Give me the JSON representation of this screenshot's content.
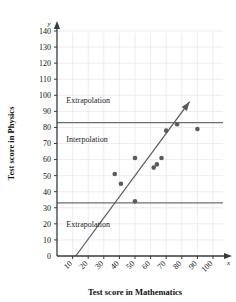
{
  "chart_data": {
    "type": "scatter",
    "title": "",
    "xlabel": "Test score in Mathematics",
    "ylabel": "Test score in Physics",
    "x_axis_symbol": "x",
    "y_axis_symbol": "y",
    "xlim": [
      0,
      100
    ],
    "ylim": [
      0,
      140
    ],
    "xticks": [
      0,
      10,
      20,
      30,
      40,
      50,
      60,
      70,
      80,
      90,
      100
    ],
    "yticks": [
      0,
      10,
      20,
      30,
      40,
      50,
      60,
      70,
      80,
      90,
      100,
      110,
      120,
      130,
      140
    ],
    "xtick_labels": [
      "0",
      "10",
      "20",
      "30",
      "40",
      "50",
      "60",
      "70",
      "80",
      "90",
      "100"
    ],
    "ytick_labels": [
      "0",
      "10",
      "20",
      "30",
      "40",
      "50",
      "60",
      "70",
      "80",
      "90",
      "100",
      "110",
      "120",
      "130",
      "140"
    ],
    "grid": true,
    "legend": "none",
    "point_color": "#5a5a5a",
    "line_color": "#5a5a5a",
    "boundary_color": "#6e6e6e",
    "grid_color": "#e4e4ec",
    "axis_color": "#3a3a3a",
    "points": [
      {
        "x": 37,
        "y": 51
      },
      {
        "x": 41,
        "y": 45
      },
      {
        "x": 50,
        "y": 61
      },
      {
        "x": 50,
        "y": 34
      },
      {
        "x": 62,
        "y": 55
      },
      {
        "x": 64,
        "y": 57
      },
      {
        "x": 67,
        "y": 61
      },
      {
        "x": 70,
        "y": 78
      },
      {
        "x": 77,
        "y": 82
      },
      {
        "x": 90,
        "y": 79
      }
    ],
    "trend_line": {
      "x1": 12,
      "y1": 0,
      "x2": 85,
      "y2": 96,
      "arrow": true
    },
    "boundaries": [
      {
        "value": 83,
        "label": "upper-interpolation-boundary"
      },
      {
        "value": 33,
        "label": "lower-interpolation-boundary"
      }
    ],
    "annotations": [
      {
        "text": "Extrapolation",
        "x": 6,
        "y": 97,
        "name": "upper-extrapolation-label"
      },
      {
        "text": "Interpolation",
        "x": 6,
        "y": 73,
        "name": "interpolation-label"
      },
      {
        "text": "Extrapolation",
        "x": 6,
        "y": 20,
        "name": "lower-extrapolation-label"
      }
    ]
  }
}
